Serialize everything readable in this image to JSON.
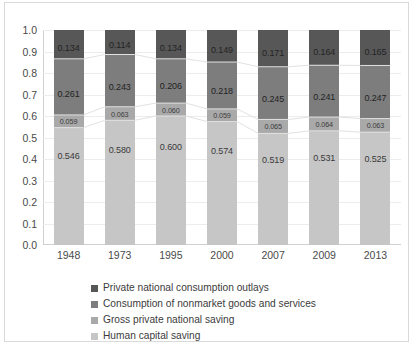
{
  "chart_data": {
    "type": "bar",
    "stacked": true,
    "title": "",
    "subtitle": "",
    "xlabel": "",
    "ylabel": "",
    "ylim": [
      0.0,
      1.0
    ],
    "grid": true,
    "legend_position": "bottom",
    "categories": [
      "1948",
      "1973",
      "1995",
      "2000",
      "2007",
      "2009",
      "2013"
    ],
    "yticks": [
      "0.0",
      "0.1",
      "0.2",
      "0.3",
      "0.4",
      "0.5",
      "0.6",
      "0.7",
      "0.8",
      "0.9",
      "1.0"
    ],
    "series": [
      {
        "name": "Private national consumption outlays",
        "color": "#575757",
        "values": [
          0.134,
          0.114,
          0.134,
          0.149,
          0.171,
          0.164,
          0.165
        ],
        "labels": [
          "0.134",
          "0.114",
          "0.134",
          "0.149",
          "0.171",
          "0.164",
          "0.165"
        ]
      },
      {
        "name": "Consumption of nonmarket goods and services",
        "color": "#7d7d7d",
        "values": [
          0.261,
          0.243,
          0.206,
          0.218,
          0.245,
          0.241,
          0.247
        ],
        "labels": [
          "0.261",
          "0.243",
          "0.206",
          "0.218",
          "0.245",
          "0.241",
          "0.247"
        ]
      },
      {
        "name": "Gross private national saving",
        "color": "#a9a9a9",
        "values": [
          0.059,
          0.063,
          0.06,
          0.059,
          0.065,
          0.064,
          0.063
        ],
        "labels": [
          "0.059",
          "0.063",
          "0.060",
          "0.059",
          "0.065",
          "0.064",
          "0.063"
        ]
      },
      {
        "name": "Human capital saving",
        "color": "#c6c6c6",
        "values": [
          0.546,
          0.58,
          0.6,
          0.574,
          0.519,
          0.531,
          0.525
        ],
        "labels": [
          "0.546",
          "0.580",
          "0.600",
          "0.574",
          "0.519",
          "0.531",
          "0.525"
        ]
      }
    ]
  },
  "legend": {
    "items": [
      {
        "label": "Private national consumption outlays",
        "color": "#575757"
      },
      {
        "label": "Consumption of nonmarket goods and services",
        "color": "#7d7d7d"
      },
      {
        "label": "Gross private national saving",
        "color": "#a9a9a9"
      },
      {
        "label": "Human capital saving",
        "color": "#c6c6c6"
      }
    ]
  },
  "caption": {
    "text": ""
  }
}
